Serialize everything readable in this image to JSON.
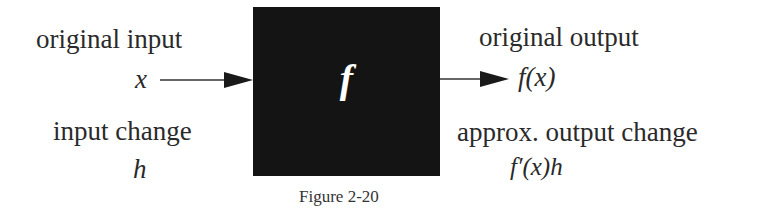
{
  "figure": {
    "caption": "Figure 2-20",
    "box": {
      "label": "f",
      "color": "#141414"
    },
    "left": {
      "input_label": "original input",
      "input_symbol": "x",
      "change_label": "input change",
      "change_symbol": "h"
    },
    "right": {
      "output_label": "original output",
      "output_symbol": "f(x)",
      "change_label": "approx. output change",
      "change_symbol": "f′(x)h"
    }
  }
}
